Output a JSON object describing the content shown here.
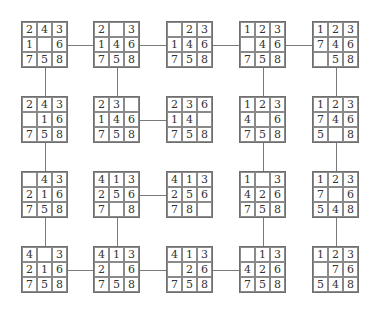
{
  "diagram": {
    "type": "8-puzzle state-space graph",
    "grid_size": 3,
    "columns_x": [
      21,
      93,
      166,
      239,
      312
    ],
    "rows_y": [
      21,
      96,
      171,
      246
    ],
    "cell_px": 15.6,
    "states": [
      {
        "id": "r1c1",
        "row": 0,
        "col": 0,
        "tiles": [
          "2",
          "4",
          "3",
          "1",
          "",
          "6",
          "7",
          "5",
          "8"
        ]
      },
      {
        "id": "r1c2",
        "row": 0,
        "col": 1,
        "tiles": [
          "2",
          "",
          "3",
          "1",
          "4",
          "6",
          "7",
          "5",
          "8"
        ]
      },
      {
        "id": "r1c3",
        "row": 0,
        "col": 2,
        "tiles": [
          "",
          "2",
          "3",
          "1",
          "4",
          "6",
          "7",
          "5",
          "8"
        ]
      },
      {
        "id": "r1c4",
        "row": 0,
        "col": 3,
        "tiles": [
          "1",
          "2",
          "3",
          "",
          "4",
          "6",
          "7",
          "5",
          "8"
        ]
      },
      {
        "id": "r1c5",
        "row": 0,
        "col": 4,
        "tiles": [
          "1",
          "2",
          "3",
          "7",
          "4",
          "6",
          "",
          "5",
          "8"
        ]
      },
      {
        "id": "r2c1",
        "row": 1,
        "col": 0,
        "tiles": [
          "2",
          "4",
          "3",
          "",
          "1",
          "6",
          "7",
          "5",
          "8"
        ]
      },
      {
        "id": "r2c2",
        "row": 1,
        "col": 1,
        "tiles": [
          "2",
          "3",
          "",
          "1",
          "4",
          "6",
          "7",
          "5",
          "8"
        ]
      },
      {
        "id": "r2c3",
        "row": 1,
        "col": 2,
        "tiles": [
          "2",
          "3",
          "6",
          "1",
          "4",
          "",
          "7",
          "5",
          "8"
        ]
      },
      {
        "id": "r2c4",
        "row": 1,
        "col": 3,
        "tiles": [
          "1",
          "2",
          "3",
          "4",
          "",
          "6",
          "7",
          "5",
          "8"
        ]
      },
      {
        "id": "r2c5",
        "row": 1,
        "col": 4,
        "tiles": [
          "1",
          "2",
          "3",
          "7",
          "4",
          "6",
          "5",
          "",
          "8"
        ]
      },
      {
        "id": "r3c1",
        "row": 2,
        "col": 0,
        "tiles": [
          "",
          "4",
          "3",
          "2",
          "1",
          "6",
          "7",
          "5",
          "8"
        ]
      },
      {
        "id": "r3c2",
        "row": 2,
        "col": 1,
        "tiles": [
          "4",
          "1",
          "3",
          "2",
          "5",
          "6",
          "7",
          "",
          "8"
        ]
      },
      {
        "id": "r3c3",
        "row": 2,
        "col": 2,
        "tiles": [
          "4",
          "1",
          "3",
          "2",
          "5",
          "6",
          "7",
          "8",
          ""
        ]
      },
      {
        "id": "r3c4",
        "row": 2,
        "col": 3,
        "tiles": [
          "1",
          "",
          "3",
          "4",
          "2",
          "6",
          "7",
          "5",
          "8"
        ]
      },
      {
        "id": "r3c5",
        "row": 2,
        "col": 4,
        "tiles": [
          "1",
          "2",
          "3",
          "7",
          "",
          "6",
          "5",
          "4",
          "8"
        ]
      },
      {
        "id": "r4c1",
        "row": 3,
        "col": 0,
        "tiles": [
          "4",
          "",
          "3",
          "2",
          "1",
          "6",
          "7",
          "5",
          "8"
        ]
      },
      {
        "id": "r4c2",
        "row": 3,
        "col": 1,
        "tiles": [
          "4",
          "1",
          "3",
          "2",
          "",
          "6",
          "7",
          "5",
          "8"
        ]
      },
      {
        "id": "r4c3",
        "row": 3,
        "col": 2,
        "tiles": [
          "4",
          "1",
          "3",
          "",
          "2",
          "6",
          "7",
          "5",
          "8"
        ]
      },
      {
        "id": "r4c4",
        "row": 3,
        "col": 3,
        "tiles": [
          "",
          "1",
          "3",
          "4",
          "2",
          "6",
          "7",
          "5",
          "8"
        ]
      },
      {
        "id": "r4c5",
        "row": 3,
        "col": 4,
        "tiles": [
          "1",
          "2",
          "3",
          "",
          "7",
          "6",
          "5",
          "4",
          "8"
        ]
      }
    ],
    "edges": [
      {
        "from": "r1c1",
        "to": "r1c2",
        "dir": "h"
      },
      {
        "from": "r1c2",
        "to": "r1c3",
        "dir": "h"
      },
      {
        "from": "r1c3",
        "to": "r1c4",
        "dir": "h"
      },
      {
        "from": "r1c4",
        "to": "r1c5",
        "dir": "h"
      },
      {
        "from": "r1c1",
        "to": "r2c1",
        "dir": "v"
      },
      {
        "from": "r1c2",
        "to": "r2c2",
        "dir": "v"
      },
      {
        "from": "r1c4",
        "to": "r2c4",
        "dir": "v"
      },
      {
        "from": "r1c5",
        "to": "r2c5",
        "dir": "v"
      },
      {
        "from": "r2c2",
        "to": "r2c3",
        "dir": "h"
      },
      {
        "from": "r2c1",
        "to": "r3c1",
        "dir": "v"
      },
      {
        "from": "r2c4",
        "to": "r3c4",
        "dir": "v"
      },
      {
        "from": "r2c5",
        "to": "r3c5",
        "dir": "v"
      },
      {
        "from": "r3c2",
        "to": "r3c3",
        "dir": "h"
      },
      {
        "from": "r3c1",
        "to": "r4c1",
        "dir": "v"
      },
      {
        "from": "r3c2",
        "to": "r4c2",
        "dir": "v"
      },
      {
        "from": "r3c4",
        "to": "r4c4",
        "dir": "v"
      },
      {
        "from": "r3c5",
        "to": "r4c5",
        "dir": "v"
      },
      {
        "from": "r4c1",
        "to": "r4c2",
        "dir": "h"
      },
      {
        "from": "r4c2",
        "to": "r4c3",
        "dir": "h"
      },
      {
        "from": "r4c3",
        "to": "r4c4",
        "dir": "h"
      }
    ],
    "colors": {
      "line": "#7a7a7a",
      "border": "#6f6f6f",
      "text": "#333333",
      "background": "#ffffff"
    }
  }
}
